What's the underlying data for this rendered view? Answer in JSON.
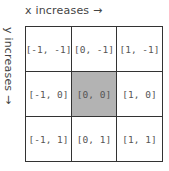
{
  "labels": {
    "x_axis": "x increases →",
    "y_axis": "y increases →"
  },
  "grid": {
    "rows": [
      [
        {
          "label": "[-1, -1]"
        },
        {
          "label": "[0, -1]"
        },
        {
          "label": "[1, -1]"
        }
      ],
      [
        {
          "label": "[-1, 0]"
        },
        {
          "label": "[0, 0]",
          "highlighted": true
        },
        {
          "label": "[1, 0]"
        }
      ],
      [
        {
          "label": "[-1, 1]"
        },
        {
          "label": "[0, 1]"
        },
        {
          "label": "[1, 1]"
        }
      ]
    ],
    "highlight_color": "#b3b3b3"
  }
}
